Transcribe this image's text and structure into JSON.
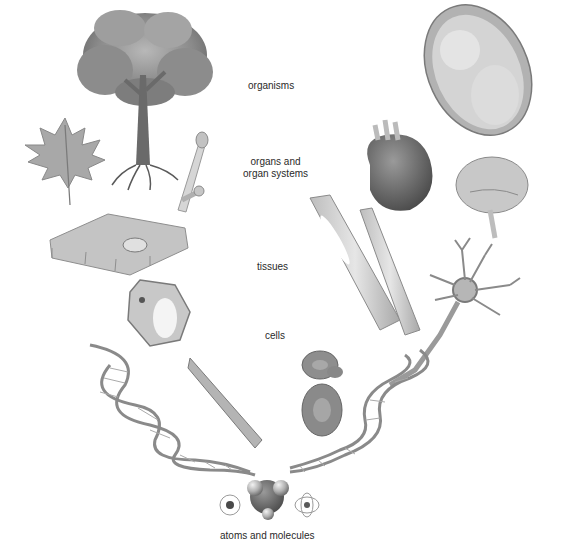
{
  "diagram": {
    "palette": {
      "background": "#ffffff",
      "ink": "#2a2a2a",
      "light_gray": "#d8d8d8",
      "mid_gray": "#9a9a9a",
      "dark_gray": "#555555"
    },
    "labels": [
      {
        "id": "organisms",
        "text": "organisms"
      },
      {
        "id": "organs",
        "line1": "organs and",
        "line2": "organ systems"
      },
      {
        "id": "tissues",
        "text": "tissues"
      },
      {
        "id": "cells",
        "text": "cells"
      },
      {
        "id": "atoms",
        "text": "atoms and molecules"
      }
    ],
    "illustrations": {
      "left_branch": [
        "tree",
        "maple-leaf",
        "plant-stem",
        "plant-epidermal-tissue",
        "plant-cell",
        "dna-helix-left",
        "muscle-cell"
      ],
      "right_branch": [
        "human-fetus",
        "heart",
        "brain",
        "blood-vessels",
        "neuron",
        "red-blood-cells",
        "dna-helix-right"
      ],
      "bottom": [
        "atom-left",
        "water-molecule",
        "atom-right"
      ]
    }
  }
}
